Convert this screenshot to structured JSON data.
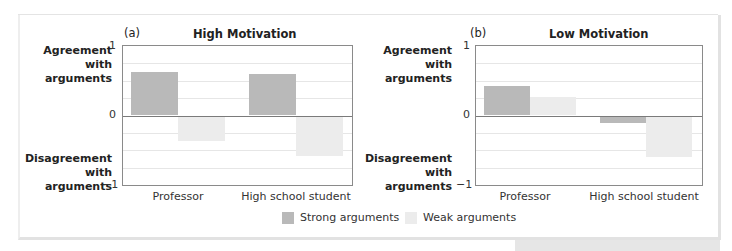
{
  "colors": {
    "strong": "#b9b9b9",
    "weak": "#ececec",
    "axis": "#8a8a8a",
    "grid": "#e6e6e6"
  },
  "legend": {
    "strong_label": "Strong arguments",
    "weak_label": "Weak arguments"
  },
  "panels": [
    {
      "tag": "(a)",
      "title": "High Motivation",
      "y_top_label": "Agreement\nwith\narguments",
      "y_bottom_label": "Disagreement\nwith\narguments",
      "ticks": {
        "top": "1",
        "zero": "0",
        "bottom": "−1"
      },
      "categories": [
        "Professor",
        "High school student"
      ]
    },
    {
      "tag": "(b)",
      "title": "Low Motivation",
      "y_top_label": "Agreement\nwith\narguments",
      "y_bottom_label": "Disagreement\nwith\narguments",
      "ticks": {
        "top": "1",
        "zero": "0",
        "bottom": "−1"
      },
      "categories": [
        "Professor",
        "High school student"
      ]
    }
  ],
  "chart_data": [
    {
      "type": "bar",
      "title": "(a) High Motivation",
      "categories": [
        "Professor",
        "High school student"
      ],
      "series": [
        {
          "name": "Strong arguments",
          "values": [
            0.63,
            0.6
          ]
        },
        {
          "name": "Weak arguments",
          "values": [
            -0.37,
            -0.58
          ]
        }
      ],
      "xlabel": "",
      "ylabel": "Agreement with arguments (+) / Disagreement with arguments (−)",
      "ylim": [
        -1,
        1
      ],
      "yticks": [
        -1,
        0,
        1
      ],
      "grid": true,
      "legend_position": "bottom"
    },
    {
      "type": "bar",
      "title": "(b) Low Motivation",
      "categories": [
        "Professor",
        "High school student"
      ],
      "series": [
        {
          "name": "Strong arguments",
          "values": [
            0.43,
            -0.11
          ]
        },
        {
          "name": "Weak arguments",
          "values": [
            0.26,
            -0.6
          ]
        }
      ],
      "xlabel": "",
      "ylabel": "Agreement with arguments (+) / Disagreement with arguments (−)",
      "ylim": [
        -1,
        1
      ],
      "yticks": [
        -1,
        0,
        1
      ],
      "grid": true,
      "legend_position": "bottom"
    }
  ]
}
